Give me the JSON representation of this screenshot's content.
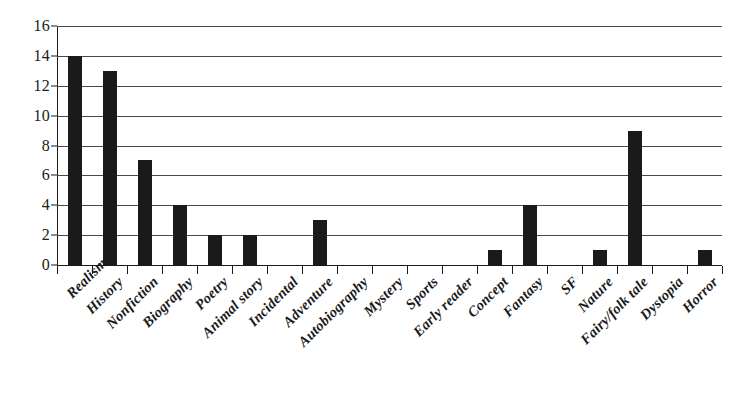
{
  "chart_data": {
    "type": "bar",
    "title": "",
    "subtitle": "",
    "xlabel": "",
    "ylabel": "",
    "ylim": [
      0,
      16
    ],
    "ytick_step": 2,
    "yticks": [
      0,
      2,
      4,
      6,
      8,
      10,
      12,
      14,
      16
    ],
    "grid": true,
    "legend": false,
    "legend_position": "none",
    "bar_color": "#1a1a1a",
    "background_color": "#ffffff",
    "axis_color": "#1a1a1a",
    "gridline_color": "#4a4a4a",
    "label_rotation_degrees": -45,
    "categories": [
      "Realism",
      "History",
      "Nonfiction",
      "Biography",
      "Poetry",
      "Animal story",
      "Incidental",
      "Adventure",
      "Autobiography",
      "Mystery",
      "Sports",
      "Early reader",
      "Concept",
      "Fantasy",
      "SF",
      "Nature",
      "Fairy/folk tale",
      "Dystopia",
      "Horror"
    ],
    "values": [
      14,
      13,
      7,
      4,
      2,
      2,
      0,
      3,
      0,
      0,
      0,
      0,
      1,
      4,
      0,
      1,
      9,
      0,
      1
    ]
  }
}
